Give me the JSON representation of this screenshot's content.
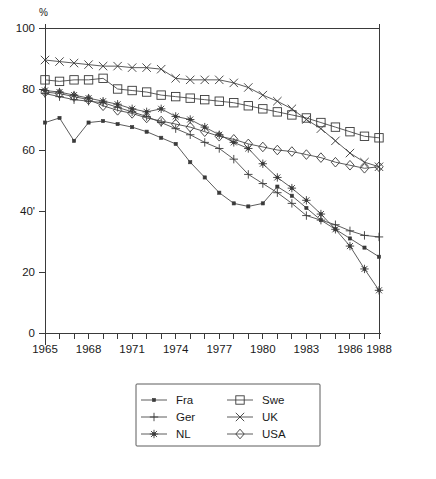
{
  "chart_data": {
    "type": "line",
    "title": "",
    "xlabel": "",
    "ylabel": "%",
    "ylim": [
      0,
      100
    ],
    "xlim": [
      1965,
      1988
    ],
    "grid": false,
    "legend_position": "bottom-center",
    "y_ticks": [
      "0",
      "20",
      "40'",
      "60",
      "80",
      "100"
    ],
    "y_tick_values": [
      0,
      20,
      40,
      60,
      80,
      100
    ],
    "x_ticks": [
      "1965",
      "1968",
      "1971",
      "1974",
      "1977",
      "1980",
      "1983",
      "1986",
      "1988"
    ],
    "x_tick_values": [
      1965,
      1968,
      1971,
      1974,
      1977,
      1980,
      1983,
      1986,
      1988
    ],
    "x": [
      1965,
      1966,
      1967,
      1968,
      1969,
      1970,
      1971,
      1972,
      1973,
      1974,
      1975,
      1976,
      1977,
      1978,
      1979,
      1980,
      1981,
      1982,
      1983,
      1984,
      1985,
      1986,
      1987,
      1988
    ],
    "series": [
      {
        "name": "Fra",
        "marker": "small-square",
        "values": [
          69,
          70.5,
          63,
          69,
          69.5,
          68.5,
          67.5,
          66,
          64,
          62,
          56,
          51,
          46,
          42.5,
          41.5,
          42.5,
          48,
          45,
          41,
          37,
          34,
          31,
          28,
          25
        ]
      },
      {
        "name": "Ger",
        "marker": "plus",
        "values": [
          78.5,
          77.5,
          76.5,
          76,
          75.5,
          74,
          72.5,
          71,
          69,
          67,
          65,
          62.5,
          60.5,
          57,
          52,
          49,
          46,
          42.5,
          38.5,
          37,
          35.5,
          33.5,
          32,
          31.5
        ]
      },
      {
        "name": "NL",
        "marker": "asterisk",
        "values": [
          79.5,
          79,
          78,
          77,
          76,
          75,
          73.5,
          72.5,
          73.5,
          71,
          70,
          67.5,
          65,
          62.5,
          60.5,
          55.5,
          51,
          47.5,
          43.5,
          39,
          34,
          28.5,
          21,
          14
        ]
      },
      {
        "name": "Swe",
        "marker": "square",
        "values": [
          83,
          82.5,
          83,
          83,
          83.5,
          80,
          79.5,
          79,
          78,
          77.5,
          77,
          76.5,
          76,
          75.5,
          74.5,
          73.5,
          72.5,
          71.5,
          70.5,
          69,
          67.5,
          66,
          64.5,
          64
        ]
      },
      {
        "name": "UK",
        "marker": "cross",
        "values": [
          89.5,
          89,
          88.5,
          88,
          87.5,
          87.5,
          87,
          87,
          86.5,
          83.5,
          83,
          83,
          83,
          82,
          80.5,
          78,
          76,
          73.5,
          70,
          67,
          63,
          59,
          56,
          54.5
        ]
      },
      {
        "name": "USA",
        "marker": "diamond",
        "values": [
          79,
          78.5,
          77.5,
          76.5,
          74.5,
          73,
          72,
          70.5,
          69.5,
          68.5,
          67.5,
          66,
          64.5,
          63.5,
          62,
          61,
          60,
          59.5,
          58.5,
          57.5,
          56,
          55,
          54,
          54.5
        ]
      }
    ],
    "legend": [
      {
        "label": "Fra",
        "marker": "small-square"
      },
      {
        "label": "Swe",
        "marker": "square"
      },
      {
        "label": "Ger",
        "marker": "plus"
      },
      {
        "label": "UK",
        "marker": "cross"
      },
      {
        "label": "NL",
        "marker": "asterisk"
      },
      {
        "label": "USA",
        "marker": "diamond"
      }
    ]
  },
  "caption": {
    "text": ""
  },
  "colors": {
    "line": "#4a4a4a",
    "axis": "#3a3a3a",
    "text": "#1a1a1a",
    "background": "#ffffff"
  }
}
